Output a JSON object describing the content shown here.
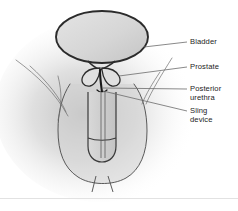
{
  "figure": {
    "kind": "medical-illustration",
    "background_color": "#ffffff",
    "vignette_color": "#9a9a9a",
    "outline_color": "#2b2b2b",
    "organ_fill_color": "#d8d8d8",
    "leader_line_color": "#6b6b6b",
    "label_text_color": "#1d1d1d",
    "bottom_rule_color": "#e2e2e2"
  },
  "labels": [
    {
      "id": "bladder",
      "text": "Bladder"
    },
    {
      "id": "prostate",
      "text": "Prostate"
    },
    {
      "id": "posterior",
      "text": "Posterior\nurethra"
    },
    {
      "id": "sling",
      "text": "Sling\ndevice"
    }
  ],
  "parts": {
    "bladder": "Bladder",
    "prostate_left_lobe": "Prostate left lobe",
    "prostate_right_lobe": "Prostate right lobe",
    "posterior_urethra": "Posterior urethra",
    "sling_device": "Sling device",
    "penile_shaft": "Penile shaft",
    "glans": "Glans",
    "scrotum": "Scrotum",
    "pelvic_tissue": "Pelvic tissue"
  }
}
